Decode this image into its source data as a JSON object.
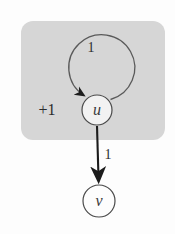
{
  "figure": {
    "background_color": "#fdfdfd",
    "region_color": "#d6d6d6",
    "stroke_color": "#4a4a4a",
    "node_fill": "#f2f2f2"
  },
  "region": {
    "name": "shaded-region",
    "x": 21,
    "y": 21,
    "width": 144,
    "height": 119,
    "corner_radius": 12
  },
  "nodes": [
    {
      "id": "u",
      "label": "u",
      "cx": 97,
      "cy": 110,
      "r": 15
    },
    {
      "id": "v",
      "label": "v",
      "cx": 99,
      "cy": 201,
      "r": 16
    }
  ],
  "edges": [
    {
      "id": "self-loop-u",
      "from": "u",
      "to": "u",
      "weight_label": "1",
      "weight_x": 91,
      "weight_y": 49
    },
    {
      "id": "edge-u-v",
      "from": "u",
      "to": "v",
      "weight_label": "1",
      "weight_x": 108,
      "weight_y": 156
    }
  ],
  "annotations": [
    {
      "id": "potential-increment",
      "label": "+1",
      "x": 47,
      "y": 111
    }
  ]
}
